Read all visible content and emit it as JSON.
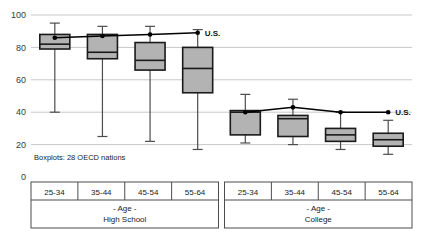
{
  "chart_data": {
    "type": "boxplot",
    "title": "",
    "subtitle": "",
    "xlabel": "",
    "ylabel": "",
    "ylim": [
      0,
      100
    ],
    "yticks": [
      0,
      20,
      40,
      60,
      80,
      100
    ],
    "grid": true,
    "legend_position": "none",
    "annotation": "Boxplots: 28 OECD nations",
    "us_series_label": "U.S.",
    "categories": [
      "25-34",
      "35-44",
      "45-54",
      "55-64",
      "25-34",
      "35-44",
      "45-54",
      "55-64"
    ],
    "groups": [
      {
        "header": "- Age -",
        "label": "High School",
        "categories": [
          "25-34",
          "35-44",
          "45-54",
          "55-64"
        ]
      },
      {
        "header": "- Age -",
        "label": "College",
        "categories": [
          "25-34",
          "35-44",
          "45-54",
          "55-64"
        ]
      }
    ],
    "boxes": [
      {
        "category": "25-34",
        "group": "High School",
        "min": 40,
        "q1": 79,
        "median": 82,
        "q3": 88,
        "max": 95,
        "us": 86
      },
      {
        "category": "35-44",
        "group": "High School",
        "min": 25,
        "q1": 73,
        "median": 77,
        "q3": 88,
        "max": 93,
        "us": 87
      },
      {
        "category": "45-54",
        "group": "High School",
        "min": 22,
        "q1": 66,
        "median": 72,
        "q3": 83,
        "max": 93,
        "us": 88
      },
      {
        "category": "55-64",
        "group": "High School",
        "min": 17,
        "q1": 52,
        "median": 67,
        "q3": 80,
        "max": 91,
        "us": 89
      },
      {
        "category": "25-34",
        "group": "College",
        "min": 21,
        "q1": 26,
        "median": 40,
        "q3": 41,
        "max": 51,
        "us": 40
      },
      {
        "category": "35-44",
        "group": "College",
        "min": 20,
        "q1": 25,
        "median": 36,
        "q3": 38,
        "max": 48,
        "us": 43
      },
      {
        "category": "45-54",
        "group": "College",
        "min": 17,
        "q1": 22,
        "median": 26,
        "q3": 30,
        "max": 40,
        "us": 40
      },
      {
        "category": "55-64",
        "group": "College",
        "min": 14,
        "q1": 19,
        "median": 23,
        "q3": 27,
        "max": 35,
        "us": 40
      }
    ],
    "us_line": [
      {
        "category": "25-34",
        "group": "High School",
        "value": 86
      },
      {
        "category": "35-44",
        "group": "High School",
        "value": 87
      },
      {
        "category": "45-54",
        "group": "High School",
        "value": 88
      },
      {
        "category": "55-64",
        "group": "High School",
        "value": 89
      },
      {
        "category": "25-34",
        "group": "College",
        "value": 40
      },
      {
        "category": "35-44",
        "group": "College",
        "value": 43
      },
      {
        "category": "45-54",
        "group": "College",
        "value": 40
      },
      {
        "category": "55-64",
        "group": "College",
        "value": 40
      }
    ],
    "colors": {
      "box_fill": "#b3b3b3",
      "box_stroke": "#1a1a1a",
      "whisker": "#4d4d4d",
      "grid": "#c8c8c8",
      "us_line": "#000000",
      "text": "#1a1a1a"
    }
  }
}
